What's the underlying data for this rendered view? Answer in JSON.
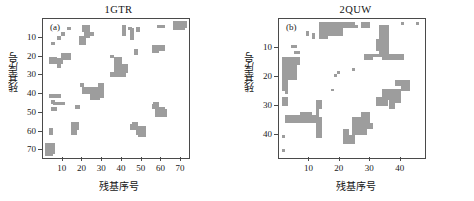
{
  "figure": {
    "panels": [
      {
        "id": "a",
        "label": "(a)",
        "title": "1GTR",
        "xlabel": "残基序号",
        "ylabel": "残基序号",
        "xticks": [
          10,
          20,
          30,
          40,
          50,
          60,
          70
        ],
        "yticks": [
          10,
          20,
          30,
          40,
          50,
          60,
          70
        ],
        "xlim": [
          0,
          74
        ],
        "ylim": [
          0,
          74
        ]
      },
      {
        "id": "b",
        "label": "(b)",
        "title": "2QUW",
        "xlabel": "残基序号",
        "ylabel": "残基序号",
        "xticks": [
          10,
          20,
          30,
          40
        ],
        "yticks": [
          10,
          20,
          30,
          40
        ],
        "xlim": [
          0,
          48
        ],
        "ylim": [
          0,
          48
        ]
      }
    ]
  },
  "colors": {
    "contact": "#9d9d9d",
    "axis": "#4a4a4a",
    "background": "#ffffff",
    "text": "#1a1a1a"
  },
  "chart_data": [
    {
      "type": "heatmap",
      "title": "1GTR",
      "xlabel": "残基序号",
      "ylabel": "残基序号",
      "xlim": [
        0,
        74
      ],
      "ylim": [
        0,
        74
      ],
      "grid": false,
      "legend": "none",
      "value_meaning": "contact (1 = residue pair in contact, shown gray)",
      "comment": "Protein residue contact map; matrix is symmetric about the diagonal. Contacts listed as upper-triangle blobs [x_start,x_end,y_start,y_end]; each is mirrored across y=x.",
      "contact_blocks": [
        [
          12,
          14,
          4,
          6
        ],
        [
          9,
          11,
          7,
          9
        ],
        [
          20,
          24,
          3,
          7
        ],
        [
          22,
          26,
          7,
          9
        ],
        [
          40,
          42,
          3,
          9
        ],
        [
          43,
          45,
          4,
          6
        ],
        [
          44,
          46,
          9,
          11
        ],
        [
          58,
          62,
          3,
          5
        ],
        [
          67,
          73,
          1,
          5
        ],
        [
          56,
          62,
          14,
          17
        ],
        [
          9,
          14,
          18,
          22
        ],
        [
          6,
          10,
          21,
          24
        ],
        [
          36,
          40,
          20,
          23
        ],
        [
          37,
          43,
          24,
          29
        ],
        [
          34,
          38,
          28,
          31
        ],
        [
          19,
          21,
          34,
          36
        ],
        [
          22,
          28,
          36,
          40
        ],
        [
          26,
          31,
          38,
          42
        ],
        [
          5,
          11,
          44,
          46
        ],
        [
          4,
          7,
          47,
          49
        ],
        [
          16,
          19,
          46,
          48
        ],
        [
          56,
          59,
          44,
          47
        ],
        [
          57,
          63,
          48,
          52
        ],
        [
          14,
          18,
          55,
          59
        ],
        [
          45,
          48,
          55,
          57
        ],
        [
          47,
          52,
          57,
          62
        ],
        [
          1,
          6,
          66,
          72
        ]
      ]
    },
    {
      "type": "heatmap",
      "title": "2QUW",
      "xlabel": "残基序号",
      "ylabel": "残基序号",
      "xlim": [
        0,
        48
      ],
      "ylim": [
        0,
        48
      ],
      "grid": false,
      "legend": "none",
      "value_meaning": "contact (1 = residue pair in contact, shown gray)",
      "comment": "Protein residue contact map; matrix is symmetric about the diagonal. Contacts listed as upper-triangle blobs [x_start,x_end,y_start,y_end]; each is mirrored across y=x.",
      "contact_blocks": [
        [
          13,
          19,
          1,
          5
        ],
        [
          16,
          21,
          3,
          6
        ],
        [
          22,
          25,
          1,
          3
        ],
        [
          27,
          30,
          1,
          3
        ],
        [
          9,
          10,
          4,
          6
        ],
        [
          33,
          36,
          2,
          8
        ],
        [
          32,
          36,
          7,
          11
        ],
        [
          31,
          40,
          12,
          13
        ],
        [
          45,
          46,
          1,
          2
        ],
        [
          5,
          7,
          11,
          12
        ],
        [
          2,
          7,
          13,
          16
        ],
        [
          1,
          4,
          16,
          20
        ],
        [
          1,
          3,
          20,
          23
        ],
        [
          2,
          3,
          24,
          26
        ],
        [
          19,
          20,
          18,
          19
        ],
        [
          17,
          18,
          24,
          25
        ],
        [
          38,
          43,
          21,
          23
        ],
        [
          34,
          40,
          24,
          28
        ],
        [
          32,
          36,
          27,
          30
        ],
        [
          12,
          14,
          28,
          31
        ],
        [
          3,
          13,
          33,
          36
        ],
        [
          12,
          14,
          34,
          41
        ],
        [
          28,
          31,
          36,
          38
        ],
        [
          24,
          29,
          37,
          40
        ],
        [
          21,
          25,
          40,
          43
        ],
        [
          1,
          2,
          40,
          41
        ]
      ]
    }
  ]
}
